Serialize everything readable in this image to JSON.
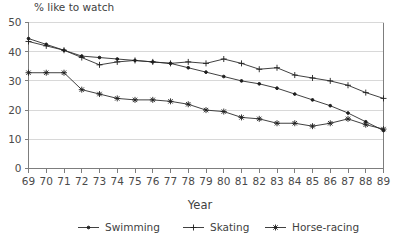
{
  "chart_data": {
    "type": "line",
    "title": "% like to watch",
    "subtitle": "",
    "xlabel": "Year",
    "ylabel": "",
    "grid": true,
    "legend_position": "bottom",
    "xlim": [
      69,
      89
    ],
    "ylim": [
      0,
      50
    ],
    "yticks": [
      0,
      10,
      20,
      30,
      40,
      50
    ],
    "ytick_labels": [
      "0",
      "10",
      "20",
      "30",
      "40",
      "50"
    ],
    "x": [
      69,
      70,
      71,
      72,
      73,
      74,
      75,
      76,
      77,
      78,
      79,
      80,
      81,
      82,
      83,
      84,
      85,
      86,
      87,
      88,
      89
    ],
    "xtick_labels": [
      "69",
      "70",
      "71",
      "72",
      "73",
      "74",
      "75",
      "76",
      "77",
      "78",
      "79",
      "80",
      "81",
      "82",
      "83",
      "84",
      "85",
      "86",
      "87",
      "88",
      "89"
    ],
    "series": [
      {
        "name": "Swimming",
        "marker": "dot",
        "values": [
          44.5,
          42.5,
          40.5,
          38.5,
          38.0,
          37.5,
          37.0,
          36.5,
          36.0,
          34.5,
          33.0,
          31.5,
          30.0,
          29.0,
          27.5,
          25.5,
          23.5,
          21.5,
          19.0,
          16.0,
          13.0
        ]
      },
      {
        "name": "Skating",
        "marker": "plus",
        "values": [
          43.5,
          42.0,
          40.5,
          38.0,
          35.5,
          36.5,
          37.0,
          36.5,
          36.0,
          36.5,
          36.0,
          37.5,
          36.0,
          34.0,
          34.5,
          32.0,
          31.0,
          30.0,
          28.5,
          26.0,
          24.0
        ]
      },
      {
        "name": "Horse-racing",
        "marker": "star",
        "values": [
          32.8,
          32.8,
          32.8,
          27.0,
          25.5,
          24.0,
          23.5,
          23.5,
          23.0,
          22.0,
          20.0,
          19.5,
          17.5,
          17.0,
          15.5,
          15.5,
          14.5,
          15.5,
          17.0,
          15.0,
          13.5
        ]
      }
    ]
  },
  "legend": {
    "items": [
      {
        "label": "Swimming",
        "marker": "dot"
      },
      {
        "label": "Skating",
        "marker": "plus"
      },
      {
        "label": "Horse-racing",
        "marker": "star"
      }
    ]
  }
}
